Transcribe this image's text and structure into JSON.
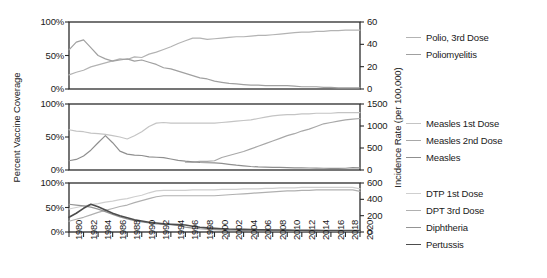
{
  "figure": {
    "width": 547,
    "height": 278,
    "background": "#ffffff"
  },
  "axes": {
    "ylabel_left": "Percent Vaccine Coverage",
    "ylabel_right": "Incidence Rate (per 100,000)",
    "xlabel": "",
    "x_ticks": [
      "1980",
      "1982",
      "1984",
      "1986",
      "1988",
      "1990",
      "1992",
      "1994",
      "1996",
      "1998",
      "2000",
      "2002",
      "2004",
      "2006",
      "2008",
      "2010",
      "2012",
      "2014",
      "2016",
      "2018",
      "2020"
    ],
    "panel1_left_ticks": [
      "0%",
      "50%",
      "100%"
    ],
    "panel1_right_ticks": [
      "0",
      "20",
      "40",
      "60"
    ],
    "panel2_left_ticks": [
      "0%",
      "50%",
      "100%"
    ],
    "panel2_right_ticks": [
      "0",
      "500",
      "1000",
      "1500"
    ],
    "panel3_left_ticks": [
      "0%",
      "50%",
      "100%"
    ],
    "panel3_right_ticks": [
      "0",
      "200",
      "400",
      "600"
    ]
  },
  "legend": {
    "groups": [
      {
        "name": "polio-legend",
        "entries": [
          {
            "label": "Polio, 3rd Dose",
            "color": "#b3b3b3",
            "width": 1.4
          },
          {
            "label": "Poliomyelitis",
            "color": "#a0a0a0",
            "width": 1.4
          }
        ]
      },
      {
        "name": "measles-legend",
        "entries": [
          {
            "label": "Measles 1st Dose",
            "color": "#c4c4c4",
            "width": 1.4
          },
          {
            "label": "Measles 2nd Dose",
            "color": "#a8a8a8",
            "width": 1.4
          },
          {
            "label": "Measles",
            "color": "#8f8f8f",
            "width": 1.4
          }
        ]
      },
      {
        "name": "dtp-legend",
        "entries": [
          {
            "label": "DTP 1st Dose",
            "color": "#cfcfcf",
            "width": 1.4
          },
          {
            "label": "DPT 3rd Dose",
            "color": "#b0b0b0",
            "width": 1.4
          },
          {
            "label": "Diphtheria",
            "color": "#949494",
            "width": 1.4
          },
          {
            "label": "Pertussis",
            "color": "#4d4d4d",
            "width": 1.8
          }
        ]
      }
    ]
  },
  "chart_data": {
    "type": "line",
    "title": "",
    "xlabel": "",
    "ylabel": "Percent Vaccine Coverage",
    "ylabel_secondary": "Incidence Rate (per 100,000)",
    "x": [
      1980,
      1981,
      1982,
      1983,
      1984,
      1985,
      1986,
      1987,
      1988,
      1989,
      1990,
      1991,
      1992,
      1993,
      1994,
      1995,
      1996,
      1997,
      1998,
      1999,
      2000,
      2001,
      2002,
      2003,
      2004,
      2005,
      2006,
      2007,
      2008,
      2009,
      2010,
      2011,
      2012,
      2013,
      2014,
      2015,
      2016,
      2017,
      2018,
      2019,
      2020
    ],
    "xlim": [
      1980,
      2020
    ],
    "grid": false,
    "legend_position": "right",
    "panels": [
      {
        "name": "polio-panel",
        "ylim_left": [
          0,
          100
        ],
        "ylim_right": [
          0,
          60
        ],
        "yticks_left": [
          0,
          50,
          100
        ],
        "yticks_right": [
          0,
          20,
          40,
          60
        ],
        "series": [
          {
            "name": "Polio, 3rd Dose",
            "axis": "left",
            "units": "percent",
            "color": "#b3b3b3",
            "values": [
              21,
              25,
              28,
              33,
              36,
              39,
              42,
              45,
              44,
              48,
              47,
              52,
              55,
              59,
              63,
              68,
              72,
              76,
              76,
              74,
              75,
              76,
              77,
              78,
              78,
              79,
              80,
              80,
              81,
              82,
              83,
              84,
              85,
              85,
              86,
              86,
              87,
              87,
              88,
              88,
              88
            ]
          },
          {
            "name": "Poliomyelitis",
            "axis": "right",
            "units": "per 100,000",
            "color": "#a0a0a0",
            "values": [
              35,
              42,
              44,
              37,
              30,
              27,
              25,
              26,
              27,
              25,
              26,
              24,
              22,
              19,
              18,
              16,
              14,
              12,
              10,
              9,
              7,
              6,
              5,
              4.5,
              4,
              3.5,
              3.5,
              3,
              3,
              3,
              3,
              2.5,
              2,
              2,
              2,
              1.5,
              1.5,
              1,
              1,
              1,
              1
            ]
          }
        ]
      },
      {
        "name": "measles-panel",
        "ylim_left": [
          0,
          100
        ],
        "ylim_right": [
          0,
          1500
        ],
        "yticks_left": [
          0,
          50,
          100
        ],
        "yticks_right": [
          0,
          500,
          1000,
          1500
        ],
        "series": [
          {
            "name": "Measles 1st Dose",
            "axis": "left",
            "units": "percent",
            "color": "#c4c4c4",
            "values": [
              61,
              59,
              58,
              56,
              55,
              54,
              52,
              50,
              47,
              52,
              58,
              66,
              71,
              72,
              71,
              71,
              71,
              71,
              71,
              71,
              71,
              72,
              73,
              74,
              75,
              76,
              78,
              80,
              82,
              83,
              84,
              84,
              85,
              85,
              86,
              86,
              86,
              87,
              87,
              87,
              87
            ]
          },
          {
            "name": "Measles 2nd Dose",
            "axis": "left",
            "units": "percent",
            "color": "#a8a8a8",
            "values": [
              null,
              null,
              null,
              null,
              null,
              null,
              null,
              null,
              null,
              null,
              null,
              null,
              null,
              null,
              null,
              null,
              12,
              12,
              13,
              13,
              14,
              19,
              22,
              25,
              28,
              32,
              36,
              40,
              44,
              48,
              52,
              55,
              59,
              62,
              66,
              70,
              72,
              74,
              76,
              77,
              78
            ]
          },
          {
            "name": "Measles",
            "axis": "right",
            "units": "per 100,000",
            "color": "#8f8f8f",
            "values": [
              210,
              240,
              320,
              450,
              620,
              780,
              620,
              430,
              360,
              340,
              330,
              300,
              290,
              280,
              250,
              220,
              200,
              185,
              170,
              165,
              160,
              150,
              130,
              110,
              95,
              80,
              70,
              65,
              60,
              58,
              55,
              50,
              48,
              45,
              42,
              40,
              38,
              36,
              40,
              55,
              48
            ]
          }
        ]
      },
      {
        "name": "dtp-panel",
        "ylim_left": [
          0,
          100
        ],
        "ylim_right": [
          0,
          600
        ],
        "yticks_left": [
          0,
          50,
          100
        ],
        "yticks_right": [
          0,
          200,
          400,
          600
        ],
        "series": [
          {
            "name": "DTP 1st Dose",
            "axis": "left",
            "units": "percent",
            "color": "#cfcfcf",
            "values": [
              47,
              50,
              53,
              56,
              58,
              61,
              63,
              66,
              68,
              72,
              75,
              80,
              84,
              85,
              85,
              85,
              85,
              86,
              86,
              86,
              86,
              87,
              87,
              87,
              88,
              88,
              88,
              89,
              89,
              90,
              90,
              90,
              91,
              91,
              91,
              91,
              91,
              91,
              91,
              91,
              88
            ]
          },
          {
            "name": "DPT 3rd Dose",
            "axis": "left",
            "units": "percent",
            "color": "#b0b0b0",
            "values": [
              22,
              26,
              30,
              35,
              40,
              44,
              48,
              52,
              55,
              60,
              64,
              68,
              72,
              74,
              74,
              74,
              74,
              74,
              74,
              74,
              74,
              75,
              76,
              77,
              78,
              79,
              80,
              81,
              82,
              83,
              84,
              84,
              85,
              85,
              86,
              86,
              86,
              86,
              86,
              86,
              83
            ]
          },
          {
            "name": "Diphtheria",
            "axis": "right",
            "units": "per 100,000",
            "color": "#949494",
            "values": [
              340,
              330,
              320,
              305,
              280,
              250,
              215,
              185,
              160,
              140,
              125,
              110,
              100,
              95,
              90,
              80,
              60,
              48,
              40,
              35,
              30,
              26,
              24,
              22,
              20,
              18,
              16,
              15,
              14,
              13,
              12,
              11,
              10,
              10,
              9,
              9,
              8,
              8,
              8,
              8,
              8
            ]
          },
          {
            "name": "Pertussis",
            "axis": "right",
            "units": "per 100,000",
            "color": "#4d4d4d",
            "values": [
              180,
              230,
              290,
              340,
              310,
              270,
              230,
              200,
              175,
              150,
              135,
              120,
              110,
              100,
              95,
              90,
              85,
              70,
              58,
              50,
              45,
              40,
              36,
              34,
              32,
              30,
              28,
              26,
              25,
              24,
              23,
              22,
              21,
              20,
              20,
              19,
              19,
              18,
              18,
              18,
              18
            ]
          }
        ]
      }
    ]
  }
}
